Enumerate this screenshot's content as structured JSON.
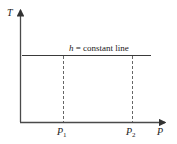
{
  "diagram": {
    "y_axis_label": "T",
    "x_axis_label": "P",
    "line_label_var": "h",
    "line_label_rest": " = constant line",
    "ticks": [
      {
        "base": "P",
        "sub": "1"
      },
      {
        "base": "P",
        "sub": "2"
      }
    ],
    "colors": {
      "axis": "#4a4a4a",
      "line": "#3a3a3a",
      "dashed": "#555555",
      "text": "#1a1a1a"
    }
  }
}
